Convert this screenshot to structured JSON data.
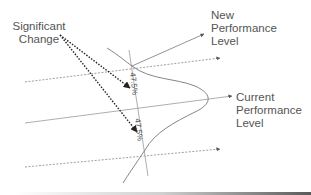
{
  "diagram": {
    "labels": {
      "significant_change": [
        "Significant",
        "Change"
      ],
      "new_performance": [
        "New",
        "Performance",
        "Level"
      ],
      "current_performance": [
        "Current",
        "Performance",
        "Level"
      ]
    },
    "percentages": {
      "upper": "47.5%",
      "lower": "47.5%"
    },
    "colors": {
      "line": "#777777",
      "dotted_arrow": "#333333",
      "text": "#555555"
    }
  }
}
